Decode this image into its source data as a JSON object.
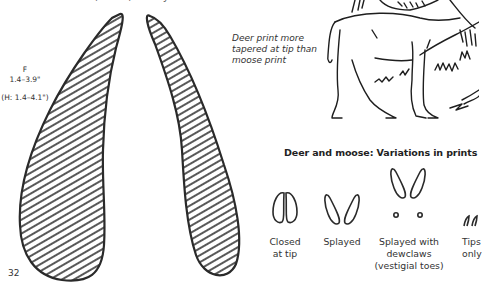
{
  "header": {
    "clipped_text": "Habitat: Forests, fields, brushy areas"
  },
  "track_illustration": {
    "icon": "deer-hoof-print-icon",
    "size_label": {
      "foot": "F",
      "front_range": "1.4–3.9\"",
      "hind_range": "(H: 1.4–4.1\")"
    },
    "note": "Deer print more tapered at tip than moose print"
  },
  "animal_illustration": {
    "icon": "deer-illustration-icon"
  },
  "variations": {
    "title": "Deer and moose: Variations in prints",
    "items": [
      {
        "icon": "closed-tip-print-icon",
        "line1": "Closed",
        "line2": "at tip",
        "line3": ""
      },
      {
        "icon": "splayed-print-icon",
        "line1": "Splayed",
        "line2": "",
        "line3": ""
      },
      {
        "icon": "splayed-dewclaws-print-icon",
        "line1": "Splayed with",
        "line2": "dewclaws",
        "line3": "(vestigial toes)"
      },
      {
        "icon": "tips-only-print-icon",
        "line1": "Tips",
        "line2": "only",
        "line3": ""
      }
    ]
  },
  "footer": {
    "page_number": "32"
  }
}
